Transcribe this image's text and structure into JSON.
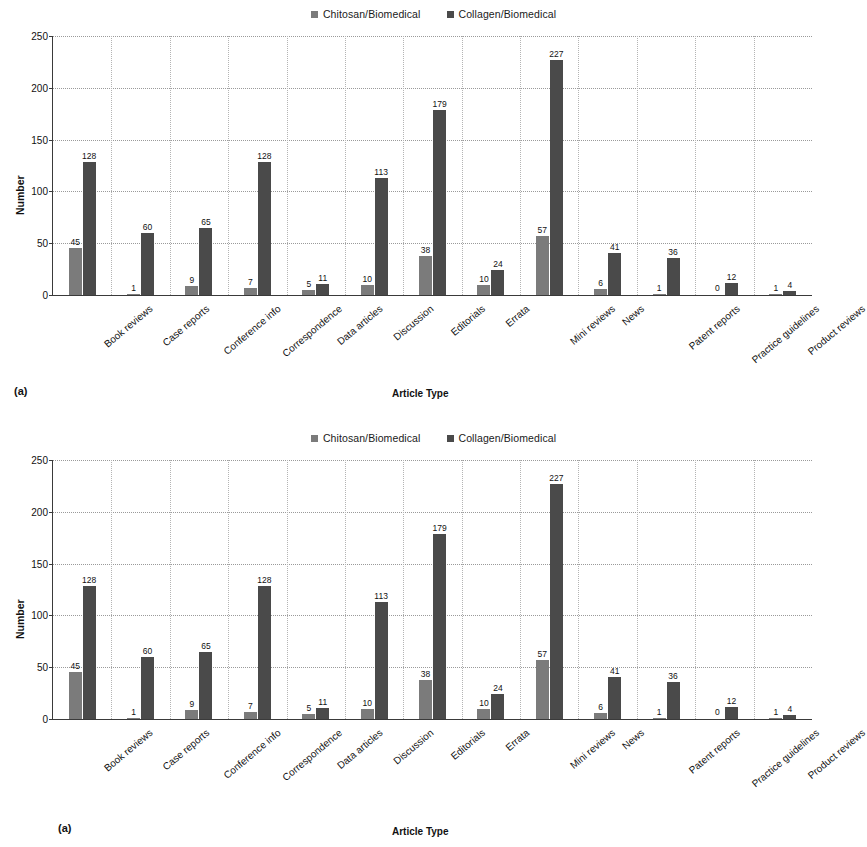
{
  "legend": {
    "items": [
      {
        "label": "Chitosan/Biomedical",
        "color": "#7b7b7b"
      },
      {
        "label": "Collagen/Biomedical",
        "color": "#4a4a4a"
      }
    ]
  },
  "panels": [
    {
      "id": "a",
      "panel_label": "(a)",
      "ylabel": "Number",
      "xlabel": "Article Type"
    },
    {
      "id": "b",
      "panel_label": "(a)",
      "ylabel": "Number",
      "xlabel": "Article Type"
    }
  ],
  "chart_data": [
    {
      "type": "bar",
      "title": "",
      "xlabel": "Article Type",
      "ylabel": "Number",
      "ylim": [
        0,
        250
      ],
      "yticks": [
        0,
        50,
        100,
        150,
        200,
        250
      ],
      "grid": true,
      "legend_position": "top-center",
      "categories": [
        "Book reviews",
        "Case reports",
        "Conference info",
        "Correspondence",
        "Data articles",
        "Discussion",
        "Editorials",
        "Errata",
        "Mini reviews",
        "News",
        "Patent reports",
        "Practice guidelines",
        "Product reviews"
      ],
      "series": [
        {
          "name": "Chitosan/Biomedical",
          "color": "#7b7b7b",
          "values": [
            45,
            1,
            9,
            7,
            5,
            10,
            38,
            10,
            57,
            6,
            1,
            0,
            1
          ]
        },
        {
          "name": "Collagen/Biomedical",
          "color": "#4a4a4a",
          "values": [
            128,
            60,
            65,
            128,
            11,
            113,
            179,
            24,
            227,
            41,
            36,
            12,
            4
          ]
        }
      ]
    },
    {
      "type": "bar",
      "title": "",
      "xlabel": "Article Type",
      "ylabel": "Number",
      "ylim": [
        0,
        250
      ],
      "yticks": [
        0,
        50,
        100,
        150,
        200,
        250
      ],
      "grid": true,
      "legend_position": "top-center",
      "categories": [
        "Book reviews",
        "Case reports",
        "Conference info",
        "Correspondence",
        "Data articles",
        "Discussion",
        "Editorials",
        "Errata",
        "Mini reviews",
        "News",
        "Patent reports",
        "Practice guidelines",
        "Product reviews"
      ],
      "series": [
        {
          "name": "Chitosan/Biomedical",
          "color": "#7b7b7b",
          "values": [
            45,
            1,
            9,
            7,
            5,
            10,
            38,
            10,
            57,
            6,
            1,
            0,
            1
          ]
        },
        {
          "name": "Collagen/Biomedical",
          "color": "#4a4a4a",
          "values": [
            128,
            60,
            65,
            128,
            11,
            113,
            179,
            24,
            227,
            41,
            36,
            12,
            4
          ]
        }
      ]
    }
  ]
}
